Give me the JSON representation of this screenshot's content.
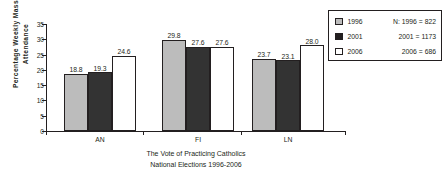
{
  "chart_data": {
    "type": "bar",
    "title": "",
    "categories": [
      "AN",
      "FI",
      "LN"
    ],
    "series": [
      {
        "name": "1996",
        "values": [
          18.8,
          29.8,
          23.7
        ],
        "color": "#bcbcbc"
      },
      {
        "name": "2001",
        "values": [
          19.3,
          27.6,
          23.1
        ],
        "color": "#333333"
      },
      {
        "name": "2006",
        "values": [
          24.6,
          27.6,
          28.0
        ],
        "color": "#ffffff"
      }
    ],
    "value_labels": [
      [
        "18.8",
        "19.3",
        "24.6"
      ],
      [
        "29.8",
        "27.6",
        "27.6"
      ],
      [
        "23.7",
        "23.1",
        "28.0"
      ]
    ],
    "xlabel": "",
    "ylabel": "Percentage Weekly Mass Attendance",
    "ylabel_lines": [
      "Percentage Weekly Mass",
      "Attendance"
    ],
    "ylim": [
      0,
      35
    ],
    "yticks": [
      0,
      5,
      10,
      15,
      20,
      25,
      30,
      35
    ],
    "ytick_labels": [
      "0",
      "5",
      "10",
      "15",
      "20",
      "25",
      "30",
      "35"
    ],
    "grid": false,
    "legend_position": "top-right",
    "caption_lines": [
      "The Vote of Practicing Catholics",
      "National Elections 1996-2006"
    ]
  },
  "legend": {
    "entries": [
      {
        "label": "1996",
        "n_text": "N: 1996 = 822"
      },
      {
        "label": "2001",
        "n_text": "2001 = 1173"
      },
      {
        "label": "2006",
        "n_text": "2006 = 686"
      }
    ]
  }
}
